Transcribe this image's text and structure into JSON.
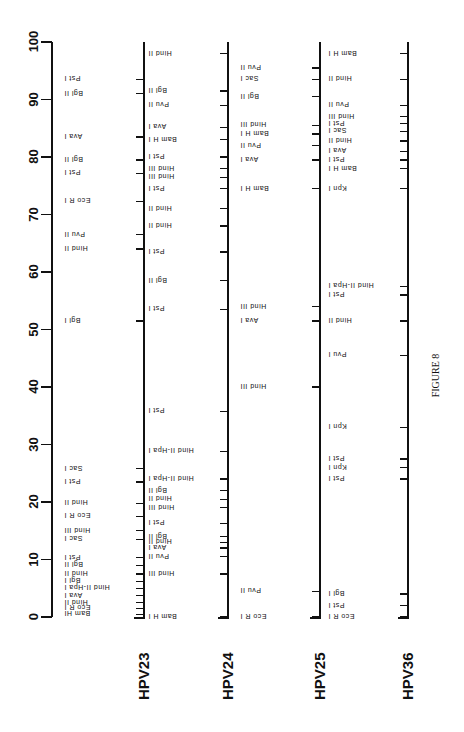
{
  "figure": {
    "caption": "FIGURE 8",
    "scale": {
      "ticks": [
        "0",
        "10",
        "20",
        "30",
        "40",
        "50",
        "60",
        "70",
        "80",
        "90",
        "100"
      ],
      "min": 0,
      "max": 100
    },
    "maps": [
      {
        "name": "HPV23",
        "sites": [
          {
            "pos": 0.5,
            "label": "Bam HI"
          },
          {
            "pos": 1.5,
            "label": "Eco R I"
          },
          {
            "pos": 2.5,
            "label": "Hind II"
          },
          {
            "pos": 3.7,
            "label": "Ava I"
          },
          {
            "pos": 5.0,
            "label": "Hind II-Hpa I"
          },
          {
            "pos": 6.2,
            "label": "Bgl I"
          },
          {
            "pos": 7.5,
            "label": "Hind II"
          },
          {
            "pos": 9.0,
            "label": "Bgl II"
          },
          {
            "pos": 10.3,
            "label": "Pst I"
          },
          {
            "pos": 13.5,
            "label": "Sac I"
          },
          {
            "pos": 15.0,
            "label": "Hind III"
          },
          {
            "pos": 17.5,
            "label": "Eco R I"
          },
          {
            "pos": 19.8,
            "label": "Hind II"
          },
          {
            "pos": 23.5,
            "label": "Pst I"
          },
          {
            "pos": 25.8,
            "label": "Sac I"
          },
          {
            "pos": 51.5,
            "label": "Bgl I"
          },
          {
            "pos": 64.0,
            "label": "Hind II"
          },
          {
            "pos": 66.5,
            "label": "Pvu II"
          },
          {
            "pos": 72.3,
            "label": "Eco R I"
          },
          {
            "pos": 77.2,
            "label": "Pst I"
          },
          {
            "pos": 79.5,
            "label": "Bgl II"
          },
          {
            "pos": 83.5,
            "label": "Ava I"
          },
          {
            "pos": 91.0,
            "label": "Bgl II"
          },
          {
            "pos": 93.5,
            "label": "Pst I"
          }
        ]
      },
      {
        "name": "HPV24",
        "sites": [
          {
            "pos": 0.0,
            "label": "Bam H I"
          },
          {
            "pos": 7.5,
            "label": "Hind III"
          },
          {
            "pos": 10.5,
            "label": "Pvu II"
          },
          {
            "pos": 12.0,
            "label": "Ava I"
          },
          {
            "pos": 13.0,
            "label": "Hind II"
          },
          {
            "pos": 14.0,
            "label": "Bgl II"
          },
          {
            "pos": 16.3,
            "label": "Pst I"
          },
          {
            "pos": 19.0,
            "label": "Hind III"
          },
          {
            "pos": 20.5,
            "label": "Hind II"
          },
          {
            "pos": 22.0,
            "label": "Bgl II"
          },
          {
            "pos": 24.0,
            "label": "Hind II-Hpa I"
          },
          {
            "pos": 28.8,
            "label": "Hind II-Hpa I"
          },
          {
            "pos": 35.8,
            "label": "Pst I"
          },
          {
            "pos": 53.5,
            "label": "Pst I"
          },
          {
            "pos": 58.5,
            "label": "Bgl II"
          },
          {
            "pos": 63.5,
            "label": "Pst I"
          },
          {
            "pos": 68.0,
            "label": "Hind II"
          },
          {
            "pos": 71.0,
            "label": "Hind II"
          },
          {
            "pos": 74.5,
            "label": "Pst I"
          },
          {
            "pos": 76.5,
            "label": "Hind III"
          },
          {
            "pos": 78.0,
            "label": "Hind III"
          },
          {
            "pos": 80.0,
            "label": "Pst I"
          },
          {
            "pos": 83.0,
            "label": "Bam H I"
          },
          {
            "pos": 85.2,
            "label": "Ava I"
          },
          {
            "pos": 89.0,
            "label": "Pvu II"
          },
          {
            "pos": 91.5,
            "label": "Bgl II"
          },
          {
            "pos": 98.0,
            "label": "Hind II"
          }
        ]
      },
      {
        "name": "HPV25",
        "sites": [
          {
            "pos": 0.0,
            "label": "Eco R I"
          },
          {
            "pos": 4.5,
            "label": "Pvu II"
          },
          {
            "pos": 40.0,
            "label": "Hind III"
          },
          {
            "pos": 51.5,
            "label": "Ava I"
          },
          {
            "pos": 54.0,
            "label": "Hind III"
          },
          {
            "pos": 74.5,
            "label": "Bam H I"
          },
          {
            "pos": 79.5,
            "label": "Ava I"
          },
          {
            "pos": 82.0,
            "label": "Pvu II"
          },
          {
            "pos": 84.0,
            "label": "Bam H I"
          },
          {
            "pos": 85.5,
            "label": "Hind III"
          },
          {
            "pos": 90.5,
            "label": "Bgl II"
          },
          {
            "pos": 93.5,
            "label": "Sac I"
          },
          {
            "pos": 95.5,
            "label": "Pvu II"
          }
        ]
      },
      {
        "name": "HPV36",
        "sites": [
          {
            "pos": 0.0,
            "label": "Eco R I"
          },
          {
            "pos": 2.0,
            "label": "Pst I"
          },
          {
            "pos": 4.0,
            "label": "Bgl I"
          },
          {
            "pos": 24.0,
            "label": "Pst I"
          },
          {
            "pos": 26.0,
            "label": "Kpn I"
          },
          {
            "pos": 27.5,
            "label": "Pst I"
          },
          {
            "pos": 33.0,
            "label": "Kpn I"
          },
          {
            "pos": 45.5,
            "label": "Pvu I"
          },
          {
            "pos": 51.5,
            "label": "Hind II"
          },
          {
            "pos": 56.0,
            "label": "Pst I"
          },
          {
            "pos": 57.5,
            "label": "Hind II-Hpa I"
          },
          {
            "pos": 74.5,
            "label": "Kpn I"
          },
          {
            "pos": 78.0,
            "label": "Bam H I"
          },
          {
            "pos": 79.5,
            "label": "Pst I"
          },
          {
            "pos": 81.0,
            "label": "Ava I"
          },
          {
            "pos": 82.8,
            "label": "Hind II"
          },
          {
            "pos": 84.5,
            "label": "Sac I"
          },
          {
            "pos": 85.8,
            "label": "Pst I"
          },
          {
            "pos": 87.0,
            "label": "Hind III"
          },
          {
            "pos": 89.0,
            "label": "Pvu II"
          },
          {
            "pos": 93.5,
            "label": "Hind II"
          },
          {
            "pos": 98.0,
            "label": "Bam H I"
          }
        ]
      }
    ]
  }
}
